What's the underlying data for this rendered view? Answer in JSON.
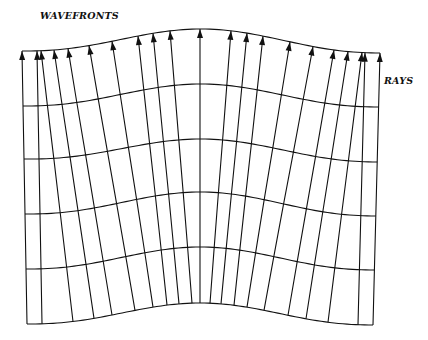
{
  "labels": {
    "wavefronts": "WAVEFRONTS",
    "rays": "RAYS"
  },
  "colors": {
    "line": "#111111",
    "background": "#ffffff"
  },
  "rays": {
    "top_x": [
      22,
      37,
      41,
      54,
      68,
      89,
      112,
      138,
      153,
      170,
      200,
      231,
      247,
      263,
      290,
      313,
      334,
      348,
      362,
      365,
      380
    ],
    "bottom_x": [
      27,
      42,
      73,
      94,
      112,
      135,
      153,
      167,
      179,
      192,
      200,
      210,
      221,
      234,
      247,
      264,
      288,
      306,
      328,
      358,
      373
    ],
    "arrowheads": true
  },
  "wavefronts": {
    "count": 6,
    "left_y": [
      51,
      106,
      159,
      214,
      269,
      324
    ],
    "center_y": [
      29,
      84,
      139,
      192,
      247,
      303
    ],
    "right_y": [
      53,
      107,
      162,
      216,
      270,
      325
    ]
  }
}
